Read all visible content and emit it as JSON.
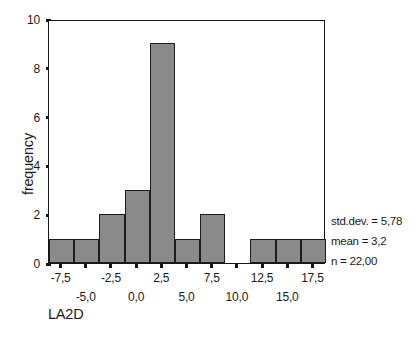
{
  "chart_data": {
    "type": "bar",
    "title": "",
    "subtitle": "",
    "xlabel": "LA2D",
    "ylabel": "frequency",
    "grid": false,
    "legend": "none",
    "bin_width": 2.5,
    "xlim": [
      -8.75,
      18.75
    ],
    "ylim": [
      0,
      10
    ],
    "x_tick_labels": [
      "-7,5",
      "-5,0",
      "-2,5",
      "0,0",
      "2,5",
      "5,0",
      "7,5",
      "10,0",
      "12,5",
      "15,0",
      "17,5"
    ],
    "x_tick_values": [
      -7.5,
      -5.0,
      -2.5,
      0.0,
      2.5,
      5.0,
      7.5,
      10.0,
      12.5,
      15.0,
      17.5
    ],
    "y_tick_labels": [
      "0",
      "2",
      "4",
      "6",
      "8",
      "10"
    ],
    "y_tick_values": [
      0,
      2,
      4,
      6,
      8,
      10
    ],
    "categories": [
      "-7,5",
      "-5,0",
      "-2,5",
      "0,0",
      "2,5",
      "5,0",
      "7,5",
      "10,0",
      "12,5",
      "15,0",
      "17,5"
    ],
    "values": [
      1,
      1,
      2,
      3,
      9,
      1,
      2,
      0,
      1,
      1,
      1
    ],
    "bar_color": "#8a8a8a",
    "bar_edge_color": "#1c1c1c",
    "axis_color": "#161616",
    "background_color": "#ffffff"
  },
  "annotations": {
    "std_dev": "std.dev. = 5,78",
    "mean": "mean = 3,2",
    "n": "n = 22,00"
  }
}
